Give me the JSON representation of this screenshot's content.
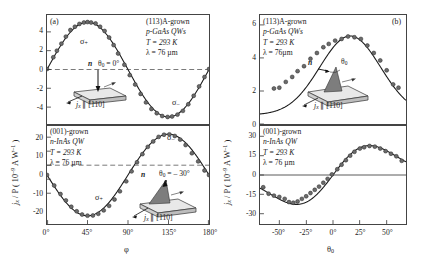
{
  "figure": {
    "panel_a_label": "(a)",
    "panel_b_label": "(b)"
  },
  "axis_labels": {
    "y_j_over_p": "j",
    "y_sub": "x",
    "y_rest": " / P  ( 10",
    "y_exp": "–9",
    "y_units": " A W",
    "y_exp2": "–1",
    "y_close": " )",
    "x_phi": "φ",
    "x_theta": "θ",
    "x_theta_sub": "0"
  },
  "panels": {
    "a_top": {
      "info_lines": [
        "(113)A-grown",
        "p-GaAs QWs",
        "T = 293 K",
        "λ = 76 µm"
      ],
      "sigma_plus": "σ",
      "sigma_plus_sub": "+",
      "sigma_minus": "σ",
      "sigma_minus_sub": "–",
      "inset_n": "n",
      "inset_theta": "θ",
      "inset_theta_sub": "0",
      "inset_theta_val": " = 0°",
      "inset_current": "j",
      "inset_current_sub": "x",
      "inset_dir": " ∥ [1̈1̈0]"
    },
    "a_bottom": {
      "info_lines": [
        "(001)-grown",
        "n-InAs QW",
        "T = 293 K",
        "λ = 76 µm"
      ],
      "sigma_plus": "σ",
      "sigma_plus_sub": "+",
      "sigma_minus": "σ",
      "sigma_minus_sub": "–",
      "inset_n": "n",
      "inset_theta": "θ",
      "inset_theta_sub": "0",
      "inset_theta_val": " = – 30°",
      "inset_current": "j",
      "inset_current_sub": "x",
      "inset_dir": " ∥ [1̈1̈0]"
    },
    "b_top": {
      "info_lines": [
        "(113)A-grown",
        "p-GaAs QWs",
        "T = 293 K",
        "λ = 76µm"
      ],
      "inset_n": "n",
      "inset_theta": "θ",
      "inset_theta_sub": "0",
      "inset_current": "j",
      "inset_current_sub": "x",
      "inset_dir": " ∥ [1̈1̈0]"
    },
    "b_bottom": {
      "info_lines": [
        "(001)-grown",
        "n-InAs QW",
        "T = 293 K",
        "λ = 76 µm"
      ]
    }
  },
  "chart_data": [
    {
      "id": "panel-a-top",
      "type": "scatter",
      "title": "(113)A-grown p-GaAs QWs",
      "xlabel": "φ",
      "ylabel": "j_x / P (10^-9 A W^-1)",
      "xlim": [
        0,
        180
      ],
      "ylim": [
        -5.8,
        5.8
      ],
      "xticks": [
        0,
        45,
        90,
        135,
        180
      ],
      "xticklabels": [
        "0°",
        "45°",
        "90°",
        "135°",
        "180°"
      ],
      "yticks": [
        4,
        2,
        0,
        -2,
        -4
      ],
      "yticklabels": [
        "4",
        "2",
        "0",
        "-2",
        "-4"
      ],
      "grid": false,
      "zero_line": true,
      "fit": {
        "form": "A*sin(2*phi)",
        "amplitude": 5.05
      },
      "points": [
        {
          "x": 0,
          "y": 0.05
        },
        {
          "x": 7,
          "y": 1.3
        },
        {
          "x": 11,
          "y": 2.0
        },
        {
          "x": 16,
          "y": 2.75
        },
        {
          "x": 21,
          "y": 3.5
        },
        {
          "x": 26,
          "y": 4.2
        },
        {
          "x": 31,
          "y": 4.55
        },
        {
          "x": 36,
          "y": 4.85
        },
        {
          "x": 41,
          "y": 5.0
        },
        {
          "x": 45,
          "y": 5.05
        },
        {
          "x": 49,
          "y": 5.0
        },
        {
          "x": 54,
          "y": 4.9
        },
        {
          "x": 59,
          "y": 4.55
        },
        {
          "x": 64,
          "y": 4.1
        },
        {
          "x": 69,
          "y": 3.4
        },
        {
          "x": 74,
          "y": 2.6
        },
        {
          "x": 79,
          "y": 1.7
        },
        {
          "x": 86,
          "y": 0.5
        },
        {
          "x": 92,
          "y": -0.6
        },
        {
          "x": 98,
          "y": -1.6
        },
        {
          "x": 104,
          "y": -2.6
        },
        {
          "x": 110,
          "y": -3.5
        },
        {
          "x": 116,
          "y": -4.2
        },
        {
          "x": 122,
          "y": -4.65
        },
        {
          "x": 128,
          "y": -4.95
        },
        {
          "x": 134,
          "y": -5.05
        },
        {
          "x": 139,
          "y": -5.0
        },
        {
          "x": 145,
          "y": -4.8
        },
        {
          "x": 151,
          "y": -4.4
        },
        {
          "x": 157,
          "y": -3.7
        },
        {
          "x": 163,
          "y": -2.8
        },
        {
          "x": 169,
          "y": -1.8
        },
        {
          "x": 175,
          "y": -0.8
        },
        {
          "x": 180,
          "y": 0.05
        }
      ],
      "annotations": [
        {
          "text": "σ+",
          "x": 45,
          "y": 3.6
        },
        {
          "text": "σ–",
          "x": 140,
          "y": -3.9
        }
      ]
    },
    {
      "id": "panel-a-bottom",
      "type": "scatter",
      "title": "(001)-grown n-InAs QW",
      "xlabel": "φ",
      "ylabel": "j_x / P (10^-9 A W^-1)",
      "xlim": [
        0,
        180
      ],
      "ylim": [
        -27,
        27
      ],
      "xticks": [
        0,
        45,
        90,
        135,
        180
      ],
      "xticklabels": [
        "0°",
        "45°",
        "90°",
        "135°",
        "180°"
      ],
      "yticks": [
        20,
        10,
        0,
        -10,
        -20
      ],
      "yticklabels": [
        "20",
        "10",
        "0",
        "-10",
        "-20"
      ],
      "grid": false,
      "zero_line": true,
      "fit": {
        "form": "-A*sin(2*phi)",
        "amplitude": 22.5
      },
      "points": [
        {
          "x": 0,
          "y": 0.0
        },
        {
          "x": 8,
          "y": -5.8
        },
        {
          "x": 15,
          "y": -10.5
        },
        {
          "x": 21,
          "y": -14.0
        },
        {
          "x": 27,
          "y": -17.5
        },
        {
          "x": 33,
          "y": -20.0
        },
        {
          "x": 39,
          "y": -21.8
        },
        {
          "x": 45,
          "y": -22.4
        },
        {
          "x": 51,
          "y": -22.3
        },
        {
          "x": 57,
          "y": -21.4
        },
        {
          "x": 63,
          "y": -19.5
        },
        {
          "x": 69,
          "y": -17.0
        },
        {
          "x": 75,
          "y": -13.5
        },
        {
          "x": 81,
          "y": -9.0
        },
        {
          "x": 88,
          "y": -3.5
        },
        {
          "x": 94,
          "y": 2.0
        },
        {
          "x": 100,
          "y": 7.0
        },
        {
          "x": 106,
          "y": 11.5
        },
        {
          "x": 112,
          "y": 15.5
        },
        {
          "x": 118,
          "y": 18.5
        },
        {
          "x": 124,
          "y": 21.0
        },
        {
          "x": 130,
          "y": 22.2
        },
        {
          "x": 136,
          "y": 22.4
        },
        {
          "x": 142,
          "y": 21.5
        },
        {
          "x": 148,
          "y": 19.5
        },
        {
          "x": 154,
          "y": 16.5
        },
        {
          "x": 161,
          "y": 12.0
        },
        {
          "x": 168,
          "y": 7.5
        },
        {
          "x": 175,
          "y": 2.5
        },
        {
          "x": 180,
          "y": 0.0
        }
      ],
      "annotations": [
        {
          "text": "σ+",
          "x": 52,
          "y": -14.0
        },
        {
          "text": "σ–",
          "x": 133,
          "y": 17.0
        }
      ]
    },
    {
      "id": "panel-b-top",
      "type": "scatter",
      "title": "(113)A-grown p-GaAs QWs",
      "xlabel": "θ0",
      "ylabel": "j_x / P (10^-9 A W^-1)",
      "xlim": [
        -68,
        68
      ],
      "ylim": [
        0,
        6.6
      ],
      "xticks": [
        -50,
        -25,
        0,
        25,
        50
      ],
      "xticklabels": [
        "-50°",
        "-25°",
        "0°",
        "25°",
        "50°"
      ],
      "yticks": [
        6,
        4,
        2,
        0
      ],
      "yticklabels": [
        "6",
        "4",
        "2",
        "0"
      ],
      "grid": false,
      "zero_line": false,
      "fit": {
        "form": "bell peaked near +18°",
        "peak_value": 5.3,
        "peak_x": 18
      },
      "points": [
        {
          "x": -55,
          "y": 2.15
        },
        {
          "x": -50,
          "y": 2.2
        },
        {
          "x": -44,
          "y": 2.55
        },
        {
          "x": -38,
          "y": 2.85
        },
        {
          "x": -33,
          "y": 3.2
        },
        {
          "x": -27,
          "y": 3.5
        },
        {
          "x": -21,
          "y": 3.95
        },
        {
          "x": -15,
          "y": 4.3
        },
        {
          "x": -9,
          "y": 4.65
        },
        {
          "x": -4,
          "y": 4.85
        },
        {
          "x": 2,
          "y": 5.05
        },
        {
          "x": 8,
          "y": 5.15
        },
        {
          "x": 14,
          "y": 5.3
        },
        {
          "x": 20,
          "y": 5.25
        },
        {
          "x": 26,
          "y": 5.15
        },
        {
          "x": 32,
          "y": 4.75
        },
        {
          "x": 38,
          "y": 4.3
        },
        {
          "x": 44,
          "y": 3.85
        },
        {
          "x": 50,
          "y": 3.25
        },
        {
          "x": 56,
          "y": 2.4
        },
        {
          "x": 61,
          "y": 2.2
        }
      ]
    },
    {
      "id": "panel-b-bottom",
      "type": "scatter",
      "title": "(001)-grown n-InAs QW",
      "xlabel": "θ0",
      "ylabel": "j_x / P (10^-9 A W^-1)",
      "xlim": [
        -68,
        68
      ],
      "ylim": [
        -38,
        38
      ],
      "xticks": [
        -50,
        -25,
        0,
        25,
        50
      ],
      "xticklabels": [
        "-50°",
        "-25°",
        "0°",
        "25°",
        "50°"
      ],
      "yticks": [
        30,
        15,
        0,
        -15,
        -30
      ],
      "yticklabels": [
        "30",
        "15",
        "0",
        "-15",
        "-30"
      ],
      "grid": false,
      "zero_line": true,
      "fit": {
        "form": "odd S-shaped curve",
        "extremum": 22.5
      },
      "points": [
        {
          "x": -65,
          "y": -9.5
        },
        {
          "x": -60,
          "y": -14.5
        },
        {
          "x": -55,
          "y": -16.0
        },
        {
          "x": -50,
          "y": -17.0
        },
        {
          "x": -45,
          "y": -18.5
        },
        {
          "x": -41,
          "y": -21.0
        },
        {
          "x": -37,
          "y": -21.5
        },
        {
          "x": -33,
          "y": -20.5
        },
        {
          "x": -29,
          "y": -18.5
        },
        {
          "x": -25,
          "y": -16.5
        },
        {
          "x": -21,
          "y": -14.0
        },
        {
          "x": -17,
          "y": -11.5
        },
        {
          "x": -13,
          "y": -9.0
        },
        {
          "x": -9,
          "y": -6.0
        },
        {
          "x": -5,
          "y": -3.0
        },
        {
          "x": -1,
          "y": 0.5
        },
        {
          "x": 4,
          "y": 4.5
        },
        {
          "x": 8,
          "y": 8.0
        },
        {
          "x": 12,
          "y": 11.5
        },
        {
          "x": 16,
          "y": 15.0
        },
        {
          "x": 20,
          "y": 18.0
        },
        {
          "x": 25,
          "y": 20.5
        },
        {
          "x": 29,
          "y": 21.5
        },
        {
          "x": 34,
          "y": 22.5
        },
        {
          "x": 39,
          "y": 22.0
        },
        {
          "x": 44,
          "y": 20.5
        },
        {
          "x": 49,
          "y": 18.5
        },
        {
          "x": 54,
          "y": 16.5
        },
        {
          "x": 59,
          "y": 14.5
        },
        {
          "x": 64,
          "y": 11.0
        }
      ]
    }
  ]
}
